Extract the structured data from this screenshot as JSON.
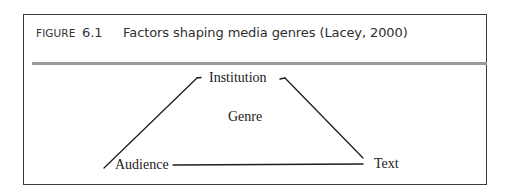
{
  "figure": {
    "label": "FIGURE",
    "number": "6.1",
    "title": "Factors shaping media genres (Lacey, 2000)"
  },
  "diagram": {
    "shape": "triangle",
    "center_label": "Genre",
    "nodes": [
      {
        "id": "institution",
        "label": "Institution",
        "position": "top"
      },
      {
        "id": "audience",
        "label": "Audience",
        "position": "bottom-left"
      },
      {
        "id": "text",
        "label": "Text",
        "position": "bottom-right"
      }
    ],
    "edges": [
      {
        "from": "audience",
        "to": "institution"
      },
      {
        "from": "institution",
        "to": "text"
      },
      {
        "from": "audience",
        "to": "text"
      }
    ],
    "colors": {
      "line": "#1e1e1e",
      "rule": "#9a9a9a",
      "frame": "#3a3a3a"
    }
  }
}
